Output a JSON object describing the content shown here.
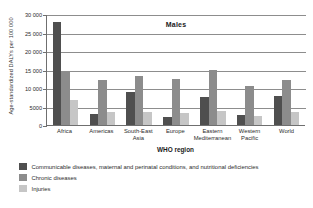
{
  "chart_data": {
    "type": "bar",
    "title": "Males",
    "xlabel": "WHO region",
    "ylabel": "Age-standardized DALYs per 100 000",
    "ylim": [
      0,
      30000
    ],
    "yticks": [
      0,
      5000,
      10000,
      15000,
      20000,
      25000,
      30000
    ],
    "ytick_labels": [
      "0",
      "5000",
      "10 000",
      "15 000",
      "20 000",
      "25 000",
      "30 000"
    ],
    "grid": true,
    "legend_position": "below",
    "categories": [
      "Africa",
      "Americas",
      "South-East Asia",
      "Europe",
      "Eastern Mediterranean",
      "Western Pacific",
      "World"
    ],
    "category_lines": [
      {
        "l1": "Africa",
        "l2": ""
      },
      {
        "l1": "Americas",
        "l2": ""
      },
      {
        "l1": "South-East",
        "l2": "Asia"
      },
      {
        "l1": "Europe",
        "l2": ""
      },
      {
        "l1": "Eastern",
        "l2": "Mediterranean"
      },
      {
        "l1": "Western",
        "l2": "Pacific"
      },
      {
        "l1": "World",
        "l2": ""
      }
    ],
    "series": [
      {
        "name": "Communicable diseases, maternal and perinatal conditions, and nutritional deficiencies",
        "color": "#4f4f4f",
        "values": [
          27800,
          2900,
          9000,
          2300,
          7600,
          2600,
          7900
        ]
      },
      {
        "name": "Chronic diseases",
        "color": "#8c8c8c",
        "values": [
          14200,
          12200,
          13200,
          12400,
          14800,
          10600,
          12300
        ]
      },
      {
        "name": "Injuries",
        "color": "#c6c6c6",
        "values": [
          6700,
          3600,
          3500,
          3300,
          3900,
          2400,
          3500
        ]
      }
    ]
  }
}
